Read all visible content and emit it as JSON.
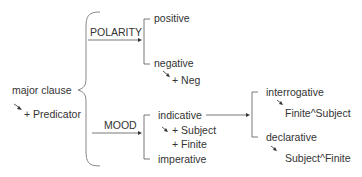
{
  "diagram": {
    "root": {
      "label": "major clause",
      "realization": "+ Predicator"
    },
    "systems": [
      {
        "name": "POLARITY",
        "options": [
          {
            "label": "positive",
            "realizations": []
          },
          {
            "label": "negative",
            "realizations": [
              "+ Neg"
            ]
          }
        ]
      },
      {
        "name": "MOOD",
        "options": [
          {
            "label": "indicative",
            "realizations": [
              "+ Subject",
              "+ Finite"
            ],
            "subsystem": {
              "options": [
                {
                  "label": "interrogative",
                  "realizations": [
                    "Finite^Subject"
                  ]
                },
                {
                  "label": "declarative",
                  "realizations": [
                    "Subject^Finite"
                  ]
                }
              ]
            }
          },
          {
            "label": "imperative",
            "realizations": []
          }
        ]
      }
    ],
    "colors": {
      "text": "#333333",
      "line": "#555555"
    }
  }
}
